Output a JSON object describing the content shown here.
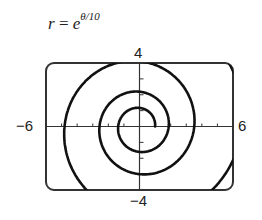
{
  "chart_data": {
    "type": "line",
    "subtype": "polar-spiral",
    "equation": {
      "lhs": "r",
      "equals": "=",
      "base": "e",
      "exponent": "θ/10"
    },
    "xlim": [
      -6,
      6
    ],
    "ylim": [
      -4,
      4
    ],
    "x_tick_labels": {
      "min": "−6",
      "max": "6"
    },
    "y_tick_labels": {
      "min": "−4",
      "max": "4"
    },
    "x_ticks_step": 1,
    "y_ticks_step": 1,
    "theta_range": [
      0,
      20
    ],
    "sample_points": [
      {
        "theta": 0,
        "r": 1.0
      },
      {
        "theta": 3.1416,
        "r": 1.37
      },
      {
        "theta": 6.2832,
        "r": 1.87
      },
      {
        "theta": 9.4248,
        "r": 2.57
      },
      {
        "theta": 12.566,
        "r": 3.51
      },
      {
        "theta": 15.708,
        "r": 4.81
      },
      {
        "theta": 18.85,
        "r": 6.59
      }
    ],
    "grid": false,
    "legend": null
  },
  "colors": {
    "curve": "#111111",
    "axes": "#333333",
    "frame": "#333333"
  }
}
